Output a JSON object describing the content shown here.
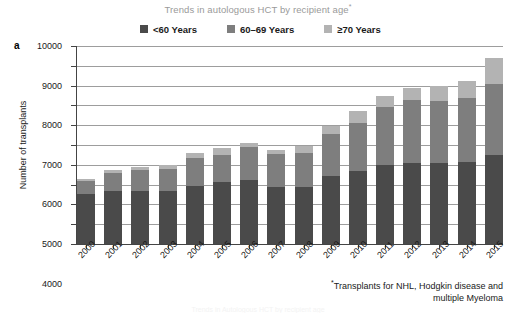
{
  "figure": {
    "panel_label": "a",
    "title": "Trends in autologous HCT by recipient age",
    "title_marker": "*",
    "footnote_marker": "*",
    "footnote_line1": "Transplants for NHL, Hodgkin disease and",
    "footnote_line2": "multiple Myeloma",
    "caption_partial": "Trends in Autologous HCT by recipient age"
  },
  "legend": {
    "position": "top-center",
    "items": [
      {
        "label": "<60 Years",
        "color": "#4a4a4a"
      },
      {
        "label": "60–69 Years",
        "color": "#7e7e7e"
      },
      {
        "label": "≥70 Years",
        "color": "#b3b3b3"
      }
    ]
  },
  "axes": {
    "ylabel": "Number of transplants",
    "xlabel": "",
    "yticks": [
      0,
      1000,
      2000,
      3000,
      4000,
      5000,
      6000,
      7000,
      8000,
      9000,
      10000
    ],
    "ylim": [
      0,
      10000
    ],
    "grid": true
  },
  "chart_data": {
    "type": "bar",
    "stacked": true,
    "title": "Trends in autologous HCT by recipient age",
    "xlabel": "",
    "ylabel": "Number of transplants",
    "ylim": [
      0,
      10000
    ],
    "grid": true,
    "legend_position": "top-center",
    "categories": [
      "2000",
      "2001",
      "2002",
      "2003",
      "2004",
      "2005",
      "2006",
      "2007",
      "2008",
      "2009",
      "2010",
      "2011",
      "2012",
      "2013",
      "2014",
      "2015"
    ],
    "series": [
      {
        "name": "<60 Years",
        "color": "#4a4a4a",
        "values": [
          2550,
          2700,
          2700,
          2700,
          2950,
          3150,
          3250,
          2900,
          2900,
          3450,
          3700,
          4000,
          4100,
          4100,
          4150,
          4500
        ]
      },
      {
        "name": "60–69 Years",
        "color": "#7e7e7e",
        "values": [
          650,
          900,
          1050,
          1100,
          1400,
          1350,
          1650,
          1650,
          1700,
          2100,
          2400,
          2900,
          3150,
          3100,
          3200,
          3600
        ]
      },
      {
        "name": "≥70 Years",
        "color": "#b3b3b3",
        "values": [
          100,
          150,
          150,
          200,
          250,
          350,
          200,
          200,
          350,
          400,
          600,
          600,
          650,
          800,
          900,
          1300
        ]
      }
    ],
    "totals": [
      3300,
      3750,
      3900,
      4000,
      4600,
      4850,
      5100,
      4750,
      4950,
      5950,
      6700,
      7500,
      7900,
      8000,
      8250,
      9400
    ]
  }
}
